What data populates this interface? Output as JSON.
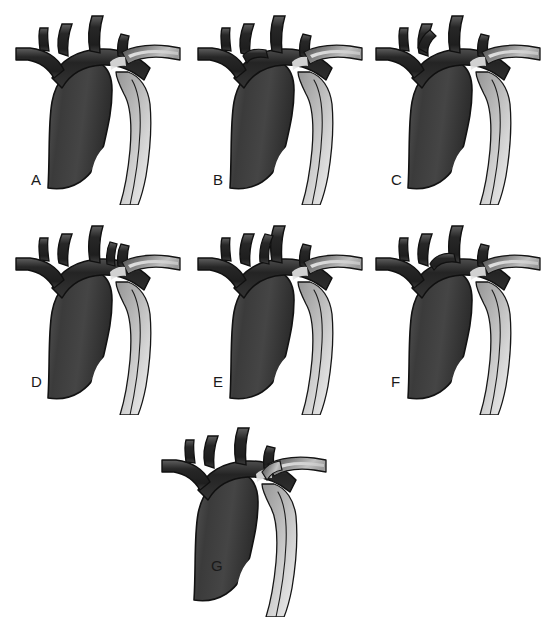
{
  "figure": {
    "background_color": "#ffffff",
    "panel_count": 7,
    "layout": "3 + 3 + 1 grid",
    "style": "grayscale medical line illustration"
  },
  "colors": {
    "background": "#ffffff",
    "arch_dark": "#2e2e2e",
    "arch_mid": "#4a4a4a",
    "arch_body": "#3d3d3d",
    "descending_light": "#d8d8d8",
    "descending_mid": "#8f8f8f",
    "outline": "#141414",
    "label_text": "#1a1a1a",
    "highlight": "#e9e9e9"
  },
  "panels": [
    {
      "id": "a",
      "label": "A",
      "name": "aortic-arch-variant-a",
      "description": "Standard three-vessel aortic arch"
    },
    {
      "id": "b",
      "label": "B",
      "name": "aortic-arch-variant-b",
      "description": "Common origin of brachiocephalic and left common carotid artery"
    },
    {
      "id": "c",
      "label": "C",
      "name": "aortic-arch-variant-c",
      "description": "Left common carotid arising from brachiocephalic trunk"
    },
    {
      "id": "d",
      "label": "D",
      "name": "aortic-arch-variant-d",
      "description": "Left vertebral artery arising directly from the arch"
    },
    {
      "id": "e",
      "label": "E",
      "name": "aortic-arch-variant-e",
      "description": "Separate origin of branch vessels from the arch"
    },
    {
      "id": "f",
      "label": "F",
      "name": "aortic-arch-variant-f",
      "description": "Bovine arch configuration variant"
    },
    {
      "id": "g",
      "label": "G",
      "name": "aortic-arch-variant-g",
      "description": "Aberrant right subclavian artery variant"
    }
  ]
}
